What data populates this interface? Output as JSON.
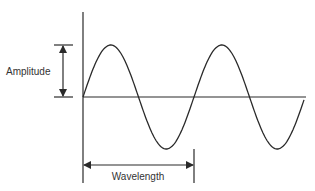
{
  "diagram": {
    "type": "wave-anatomy",
    "labels": {
      "amplitude": "Amplitude",
      "wavelength": "Wavelength"
    },
    "colors": {
      "stroke": "#2a2a2a",
      "background": "#ffffff",
      "text": "#333333"
    },
    "wave": {
      "cycles": 2,
      "baseline_y": 97,
      "amplitude_px": 52,
      "start_x": 83,
      "end_x": 304,
      "wavelength_px": 111
    }
  }
}
